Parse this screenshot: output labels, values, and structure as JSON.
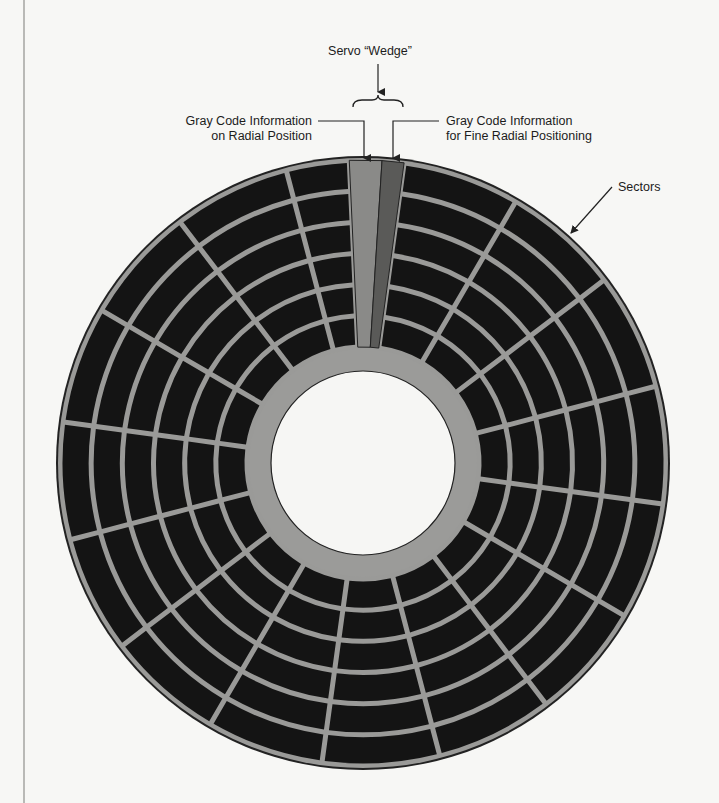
{
  "diagram": {
    "title": "Servo “Wedge”",
    "labels": {
      "servo_wedge": "Servo “Wedge”",
      "gray_code_radial_line1": "Gray Code Information",
      "gray_code_radial_line2": "on Radial Position",
      "gray_code_fine_line1": "Gray Code Information",
      "gray_code_fine_line2": "for Fine Radial Positioning",
      "sectors": "Sectors"
    },
    "disk": {
      "track_count": 6,
      "sector_count": 16
    },
    "colors": {
      "background": "#f7f7f5",
      "sector_fill": "#141414",
      "divider": "#9a9a98",
      "hub_ring": "#9b9b99",
      "hole": "#f6f6f4",
      "wedge_radial": "#8a8a88",
      "wedge_fine": "#5a5a58",
      "outline": "#222222"
    }
  }
}
